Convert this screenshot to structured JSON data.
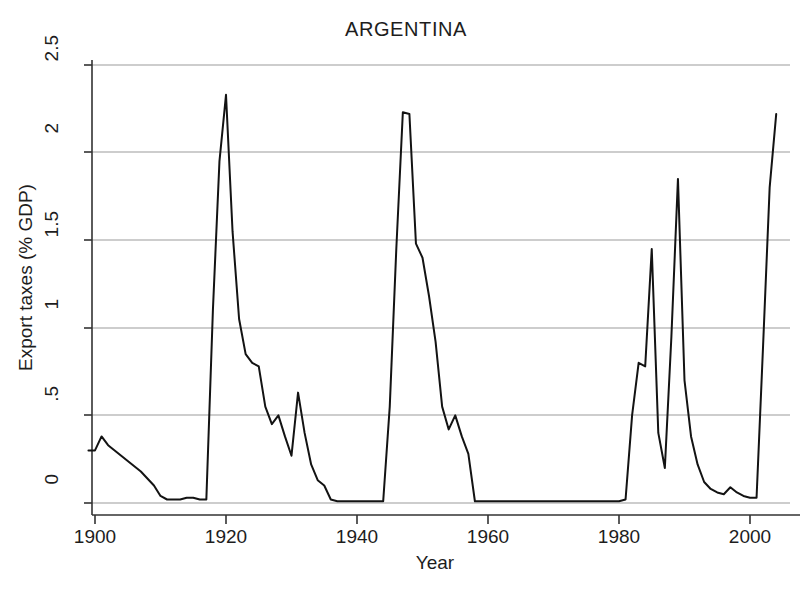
{
  "chart_data": {
    "type": "line",
    "title": "ARGENTINA",
    "xlabel": "Year",
    "ylabel": "Export taxes (% GDP)",
    "xlim": [
      1899,
      2005
    ],
    "ylim": [
      0,
      2.5
    ],
    "grid": true,
    "legend": null,
    "xticks": [
      1900,
      1920,
      1940,
      1960,
      1980,
      2000
    ],
    "xtick_labels": [
      "1900",
      "1920",
      "1940",
      "1960",
      "1980",
      "2000"
    ],
    "yticks": [
      0,
      0.5,
      1,
      1.5,
      2,
      2.5
    ],
    "ytick_labels": [
      "0",
      ".5",
      "1",
      "1.5",
      "2",
      "2.5"
    ],
    "series": [
      {
        "name": "Export taxes (% GDP)",
        "color": "#131313",
        "x": [
          1899,
          1900,
          1901,
          1902,
          1903,
          1904,
          1905,
          1906,
          1907,
          1908,
          1909,
          1910,
          1911,
          1912,
          1913,
          1914,
          1915,
          1916,
          1917,
          1918,
          1919,
          1920,
          1921,
          1922,
          1923,
          1924,
          1925,
          1926,
          1927,
          1928,
          1929,
          1930,
          1931,
          1932,
          1933,
          1934,
          1935,
          1936,
          1937,
          1938,
          1939,
          1940,
          1941,
          1942,
          1943,
          1944,
          1945,
          1946,
          1947,
          1948,
          1949,
          1950,
          1951,
          1952,
          1953,
          1954,
          1955,
          1956,
          1957,
          1958,
          1959,
          1960,
          1961,
          1962,
          1963,
          1964,
          1965,
          1966,
          1967,
          1968,
          1969,
          1970,
          1971,
          1972,
          1973,
          1974,
          1975,
          1976,
          1977,
          1978,
          1979,
          1980,
          1981,
          1982,
          1983,
          1984,
          1985,
          1986,
          1987,
          1988,
          1989,
          1990,
          1991,
          1992,
          1993,
          1994,
          1995,
          1996,
          1997,
          1998,
          1999,
          2000,
          2001,
          2002,
          2003,
          2004
        ],
        "y": [
          0.3,
          0.3,
          0.38,
          0.33,
          0.3,
          0.27,
          0.24,
          0.21,
          0.18,
          0.14,
          0.1,
          0.04,
          0.02,
          0.02,
          0.02,
          0.03,
          0.03,
          0.02,
          0.02,
          1.1,
          1.95,
          2.33,
          1.55,
          1.05,
          0.85,
          0.8,
          0.78,
          0.55,
          0.45,
          0.5,
          0.38,
          0.27,
          0.63,
          0.4,
          0.22,
          0.13,
          0.1,
          0.02,
          0.01,
          0.01,
          0.01,
          0.01,
          0.01,
          0.01,
          0.01,
          0.01,
          0.55,
          1.45,
          2.23,
          2.22,
          1.48,
          1.4,
          1.18,
          0.92,
          0.55,
          0.42,
          0.5,
          0.38,
          0.28,
          0.01,
          0.01,
          0.01,
          0.01,
          0.01,
          0.01,
          0.01,
          0.01,
          0.01,
          0.01,
          0.01,
          0.01,
          0.01,
          0.01,
          0.01,
          0.01,
          0.01,
          0.01,
          0.01,
          0.01,
          0.01,
          0.01,
          0.01,
          0.02,
          0.5,
          0.8,
          0.78,
          1.45,
          0.4,
          0.2,
          0.95,
          1.85,
          0.7,
          0.38,
          0.22,
          0.12,
          0.08,
          0.06,
          0.05,
          0.09,
          0.06,
          0.04,
          0.03,
          0.03,
          0.9,
          1.8,
          2.22
        ]
      }
    ],
    "notes": {
      "peak_1920": 2.33,
      "peak_1947": 2.23,
      "peak_1985": 1.45,
      "peak_1989": 1.85,
      "peak_2004": 2.22,
      "first_peak_1901": 0.38
    }
  }
}
